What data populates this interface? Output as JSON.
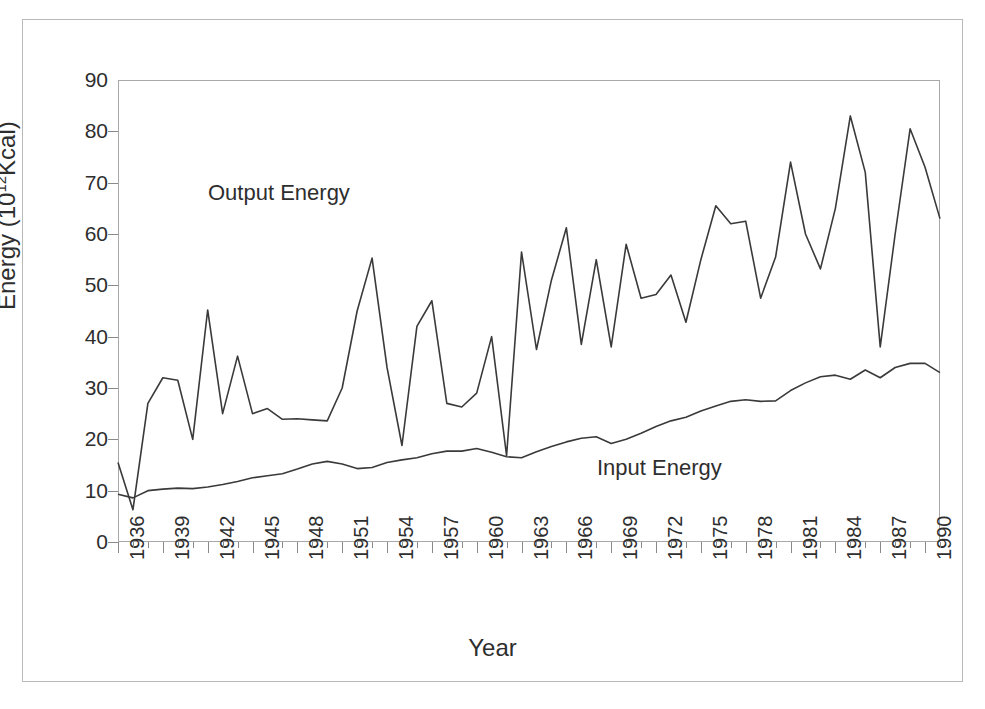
{
  "chart_data": {
    "type": "line",
    "title": "",
    "xlabel": "Year",
    "ylabel": "Energy (10^12 Kcal)",
    "ylabel_base": "Energy  (10",
    "ylabel_exp": "12",
    "ylabel_tail": "Kcal)",
    "ylim": [
      0,
      90
    ],
    "yticks": [
      90,
      80,
      70,
      60,
      50,
      40,
      30,
      20,
      10,
      0
    ],
    "xlim": [
      1936,
      1991
    ],
    "xticks": [
      1936,
      1939,
      1942,
      1945,
      1948,
      1951,
      1954,
      1957,
      1960,
      1963,
      1966,
      1969,
      1972,
      1975,
      1978,
      1981,
      1984,
      1987,
      1990
    ],
    "xtick_interval": 3,
    "x": [
      1936,
      1937,
      1938,
      1939,
      1940,
      1941,
      1942,
      1943,
      1944,
      1945,
      1946,
      1947,
      1948,
      1949,
      1950,
      1951,
      1952,
      1953,
      1954,
      1955,
      1956,
      1957,
      1958,
      1959,
      1960,
      1961,
      1962,
      1963,
      1964,
      1965,
      1966,
      1967,
      1968,
      1969,
      1970,
      1971,
      1972,
      1973,
      1974,
      1975,
      1976,
      1977,
      1978,
      1979,
      1980,
      1981,
      1982,
      1983,
      1984,
      1985,
      1986,
      1987,
      1988,
      1989,
      1990,
      1991
    ],
    "grid": false,
    "legend_position": "inline-annotations",
    "line_color": "#3a3a3a",
    "series": [
      {
        "name": "Output Energy",
        "annotation": "Output Energy",
        "values": [
          15.5,
          6.3,
          27.0,
          32.0,
          31.5,
          20.0,
          45.2,
          25.0,
          36.2,
          25.0,
          26.0,
          23.9,
          24.0,
          23.8,
          23.6,
          30.0,
          45.0,
          55.3,
          34.0,
          18.8,
          42.0,
          47.0,
          27.0,
          26.3,
          29.0,
          40.0,
          16.8,
          56.5,
          37.5,
          51.0,
          61.2,
          38.5,
          55.0,
          38.0,
          58.0,
          47.5,
          48.2,
          52.0,
          42.8,
          55.0,
          65.5,
          62.0,
          62.5,
          47.5,
          55.5,
          74.0,
          60.0,
          53.2,
          65.0,
          83.0,
          72.0,
          38.0,
          60.0,
          80.5,
          73.0,
          63.0
        ]
      },
      {
        "name": "Input Energy",
        "annotation": "Input Energy",
        "values": [
          9.3,
          8.6,
          10.0,
          10.3,
          10.5,
          10.4,
          10.7,
          11.2,
          11.8,
          12.5,
          12.9,
          13.3,
          14.2,
          15.2,
          15.7,
          15.2,
          14.3,
          14.5,
          15.5,
          16.0,
          16.4,
          17.2,
          17.7,
          17.7,
          18.2,
          17.5,
          16.6,
          16.4,
          17.6,
          18.6,
          19.5,
          20.2,
          20.5,
          19.2,
          20.0,
          21.2,
          22.5,
          23.6,
          24.3,
          25.5,
          26.5,
          27.4,
          27.7,
          27.4,
          27.5,
          29.5,
          31.0,
          32.2,
          32.5,
          31.7,
          33.5,
          32.0,
          34.0,
          34.8,
          34.8,
          33.0
        ]
      }
    ]
  },
  "annotations": {
    "output_label": "Output Energy",
    "input_label": "Input Energy"
  }
}
